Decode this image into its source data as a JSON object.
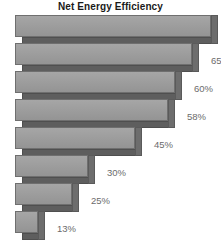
{
  "chart_data": {
    "type": "bar",
    "orientation": "horizontal",
    "title": "Net Energy Efficiency",
    "xlabel": "",
    "ylabel": "",
    "grid": false,
    "legend": false,
    "style": "3d-funnel",
    "value_suffix": "%",
    "xlim": [
      0,
      100
    ],
    "categories": [
      "1",
      "2",
      "3",
      "4",
      "5",
      "6",
      "7",
      "8"
    ],
    "values": [
      100,
      65,
      60,
      58,
      45,
      30,
      25,
      13
    ],
    "labels": [
      "",
      "65%",
      "60%",
      "58%",
      "45%",
      "30%",
      "25%",
      "13%"
    ],
    "bars": [
      {
        "value": 100,
        "label": "",
        "bar_width": 196,
        "label_x": 0,
        "show_label": false
      },
      {
        "value": 65,
        "label": "65%",
        "bar_width": 177,
        "label_x": 196,
        "show_label": true
      },
      {
        "value": 60,
        "label": "60%",
        "bar_width": 160,
        "label_x": 179,
        "show_label": true
      },
      {
        "value": 58,
        "label": "58%",
        "bar_width": 153,
        "label_x": 172,
        "show_label": true
      },
      {
        "value": 45,
        "label": "45%",
        "bar_width": 120,
        "label_x": 139,
        "show_label": true
      },
      {
        "value": 30,
        "label": "30%",
        "bar_width": 73,
        "label_x": 92,
        "show_label": true
      },
      {
        "value": 25,
        "label": "25%",
        "bar_width": 57,
        "label_x": 76,
        "show_label": true
      },
      {
        "value": 13,
        "label": "13%",
        "bar_width": 23,
        "label_x": 42,
        "show_label": true
      }
    ],
    "colors": {
      "bar_face": "#9c9c9c",
      "bar_side": "#6d6d6d",
      "bar_bottom": "#5e5e5e",
      "bar_outline": "#6f6f6f",
      "title_text": "#1a1a1a",
      "label_text": "#6b6b6b",
      "background": "#ffffff"
    },
    "geometry": {
      "row_pitch": 28,
      "bar_height": 22,
      "depth": 7,
      "plot_left": 15,
      "plot_top": 15
    }
  }
}
